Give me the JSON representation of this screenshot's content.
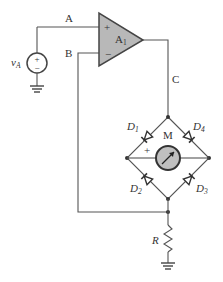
{
  "diagram": {
    "type": "circuit-schematic",
    "nodes": {
      "A": "A",
      "B": "B",
      "C": "C"
    },
    "source": {
      "label": "v",
      "subscript": "A",
      "plus": "+",
      "minus": "−"
    },
    "opamp": {
      "label": "A",
      "subscript": "1",
      "plus": "+",
      "minus": "−",
      "fill": "#b8b8b8"
    },
    "meter": {
      "label": "M",
      "plus": "+",
      "fill": "#c0c0c0"
    },
    "diodes": [
      {
        "label": "D",
        "subscript": "1"
      },
      {
        "label": "D",
        "subscript": "2"
      },
      {
        "label": "D",
        "subscript": "3"
      },
      {
        "label": "D",
        "subscript": "4"
      }
    ],
    "resistor": {
      "label": "R"
    },
    "colors": {
      "wire": "#555555",
      "component_fill": "#b8b8b8"
    }
  }
}
